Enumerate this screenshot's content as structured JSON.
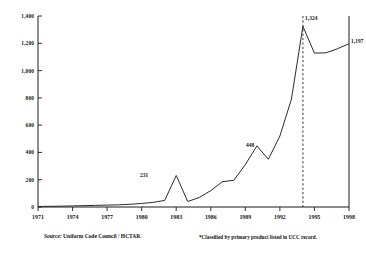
{
  "chart_data": {
    "type": "line",
    "title": "",
    "subtitle": "",
    "xlabel": "",
    "ylabel": "Annual Registrations",
    "xlim": [
      1971,
      1998
    ],
    "ylim": [
      0,
      1400
    ],
    "grid": false,
    "legend": null,
    "x_ticks": [
      "1971",
      "1974",
      "1977",
      "1980",
      "1983",
      "1986",
      "1989",
      "1992",
      "1995",
      "1998"
    ],
    "y_ticks": [
      "0",
      "200",
      "400",
      "600",
      "800",
      "1,000",
      "1,200",
      "1,400"
    ],
    "x": [
      1971,
      1972,
      1973,
      1974,
      1975,
      1976,
      1977,
      1978,
      1979,
      1980,
      1981,
      1982,
      1983,
      1984,
      1985,
      1986,
      1987,
      1988,
      1989,
      1990,
      1991,
      1992,
      1993,
      1994,
      1995,
      1996,
      1997,
      1998
    ],
    "values": [
      4,
      5,
      6,
      8,
      10,
      12,
      14,
      16,
      20,
      26,
      34,
      48,
      231,
      40,
      70,
      120,
      185,
      196,
      310,
      448,
      350,
      520,
      790,
      1324,
      1128,
      1130,
      1160,
      1197
    ],
    "series": [
      {
        "name": "Annual Registrations",
        "values": [
          4,
          5,
          6,
          8,
          10,
          12,
          14,
          16,
          20,
          26,
          34,
          48,
          231,
          40,
          70,
          120,
          185,
          196,
          310,
          448,
          350,
          520,
          790,
          1324,
          1128,
          1130,
          1160,
          1197
        ]
      }
    ],
    "data_labels": [
      {
        "x": 1983,
        "y": 231,
        "text": "231"
      },
      {
        "x": 1990,
        "y": 448,
        "text": "448"
      },
      {
        "x": 1994,
        "y": 1324,
        "text": "1,324"
      },
      {
        "x": 1998,
        "y": 1197,
        "text": "1,197"
      }
    ],
    "annotations": [
      {
        "type": "vline",
        "x": 1994,
        "style": "dashed"
      }
    ],
    "line_color": "#2b2b2b",
    "axis_color": "#1a1a1a"
  },
  "footer": {
    "source_label": "Source:",
    "source_text": "Uniform Code Council / HCTAR.",
    "footnote": "*Classified by primary product listed in UCC record."
  }
}
